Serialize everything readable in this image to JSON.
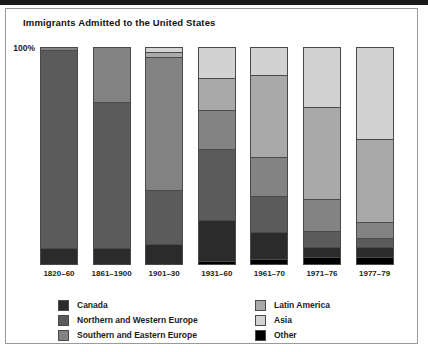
{
  "chart_data": {
    "type": "bar",
    "subtype": "stacked-percentage",
    "title": "Immigrants Admitted to the United States",
    "xlabel": "",
    "ylabel": "",
    "ylim": [
      0,
      100
    ],
    "ytick_labels": [
      "100%"
    ],
    "grid": false,
    "legend_position": "bottom",
    "categories": [
      "1820–60",
      "1861–1900",
      "1901–30",
      "1931–60",
      "1961–70",
      "1971–76",
      "1977–79"
    ],
    "series": [
      {
        "name": "Canada",
        "color": "#2b2b2b",
        "values": [
          7,
          7,
          9,
          19,
          12,
          4,
          4
        ]
      },
      {
        "name": "Northern and Western Europe",
        "color": "#5b5b5b",
        "values": [
          92,
          68,
          25,
          33,
          17,
          7,
          4
        ]
      },
      {
        "name": "Southern and Eastern Europe",
        "color": "#838383",
        "values": [
          1,
          25,
          62,
          18,
          18,
          15,
          7
        ]
      },
      {
        "name": "Latin America",
        "color": "#a9a9a9",
        "values": [
          0,
          0,
          2,
          15,
          38,
          43,
          39
        ]
      },
      {
        "name": "Asia",
        "color": "#d2d2d2",
        "values": [
          0,
          0,
          2,
          14,
          13,
          28,
          43
        ]
      },
      {
        "name": "Other",
        "color": "#000000",
        "values": [
          0,
          0,
          0,
          1,
          2,
          3,
          3
        ]
      }
    ],
    "stack_order_top_to_bottom": [
      "Asia",
      "Latin America",
      "Southern and Eastern Europe",
      "Northern and Western Europe",
      "Canada",
      "Other"
    ]
  },
  "legend": {
    "left_column": [
      {
        "label": "Canada",
        "color": "#2b2b2b"
      },
      {
        "label": "Northern and Western Europe",
        "color": "#5b5b5b"
      },
      {
        "label": "Southern and Eastern Europe",
        "color": "#838383"
      }
    ],
    "right_column": [
      {
        "label": "Latin America",
        "color": "#a9a9a9"
      },
      {
        "label": "Asia",
        "color": "#d2d2d2"
      },
      {
        "label": "Other",
        "color": "#000000"
      }
    ]
  }
}
